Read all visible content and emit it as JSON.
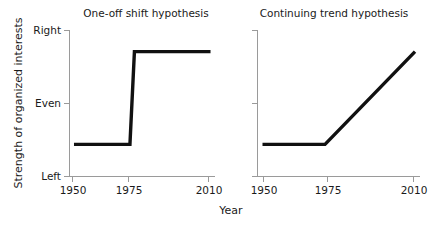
{
  "figure": {
    "xlabel": "Year",
    "ylabel": "Strength of organized interests"
  },
  "chart_data": [
    {
      "type": "line",
      "title": "One-off shift hypothesis",
      "xlabel": "Year",
      "ylabel": "Strength of organized interests",
      "x": [
        1950,
        1975,
        1977,
        2011
      ],
      "values": [
        0.22,
        0.22,
        0.855,
        0.855
      ],
      "xlim": [
        1948,
        2013
      ],
      "xticks": [
        1950,
        1975,
        2010
      ],
      "xticklabels": [
        "1950",
        "1975",
        "2010"
      ],
      "ylim": [
        0,
        1
      ],
      "yticks": [
        0,
        0.5,
        1
      ],
      "yticklabels": [
        "Left",
        "Even",
        "Right"
      ],
      "grid": false,
      "legend": "none",
      "annotation": "Flat at a low (Left-leaning) level from 1950 to 1975, then an abrupt step up to a high level just below Right, held flat through 2010."
    },
    {
      "type": "line",
      "title": "Continuing trend hypothesis",
      "xlabel": "Year",
      "ylabel": "Strength of organized interests",
      "x": [
        1950,
        1975,
        2011
      ],
      "values": [
        0.22,
        0.22,
        0.855
      ],
      "xlim": [
        1948,
        2013
      ],
      "xticks": [
        1950,
        1975,
        2010
      ],
      "xticklabels": [
        "1950",
        "1975",
        "2010"
      ],
      "ylim": [
        0,
        1
      ],
      "yticks": [
        0,
        0.5,
        1
      ],
      "yticklabels": [
        "Left",
        "Even",
        "Right"
      ],
      "grid": false,
      "legend": "none",
      "annotation": "Flat at a low (Left-leaning) level from 1950 to 1975, then a steady linear rise through 2010 to a high level just below Right."
    }
  ]
}
